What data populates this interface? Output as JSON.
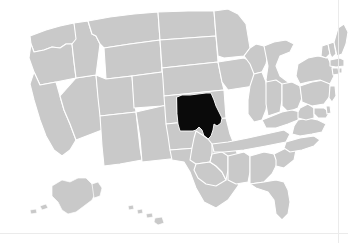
{
  "figure": {
    "type": "choropleth-locator-map",
    "title": "United States map with Missouri highlighted",
    "region_scope": "United States of America",
    "projection_note": "Albers-style composite with Alaska and Hawaii insets",
    "background_color": "#ffffff",
    "border_line_color": "#ebebeb"
  },
  "legend": {
    "default_fill": "#c9c9c9",
    "highlight_fill": "#0a0a0a",
    "border_stroke": "#ffffff",
    "default_label": "Other states",
    "highlight_label": "Missouri"
  },
  "highlighted": {
    "name": "Missouri",
    "abbr": "MO",
    "fill": "#0a0a0a"
  },
  "insets": [
    {
      "name": "Alaska",
      "abbr": "AK",
      "fill": "#c9c9c9"
    },
    {
      "name": "Hawaii",
      "abbr": "HI",
      "fill": "#c9c9c9"
    }
  ],
  "states": [
    {
      "abbr": "WA",
      "name": "Washington",
      "fill": "#c9c9c9"
    },
    {
      "abbr": "OR",
      "name": "Oregon",
      "fill": "#c9c9c9"
    },
    {
      "abbr": "CA",
      "name": "California",
      "fill": "#c9c9c9"
    },
    {
      "abbr": "NV",
      "name": "Nevada",
      "fill": "#c9c9c9"
    },
    {
      "abbr": "ID",
      "name": "Idaho",
      "fill": "#c9c9c9"
    },
    {
      "abbr": "MT",
      "name": "Montana",
      "fill": "#c9c9c9"
    },
    {
      "abbr": "WY",
      "name": "Wyoming",
      "fill": "#c9c9c9"
    },
    {
      "abbr": "UT",
      "name": "Utah",
      "fill": "#c9c9c9"
    },
    {
      "abbr": "AZ",
      "name": "Arizona",
      "fill": "#c9c9c9"
    },
    {
      "abbr": "CO",
      "name": "Colorado",
      "fill": "#c9c9c9"
    },
    {
      "abbr": "NM",
      "name": "New Mexico",
      "fill": "#c9c9c9"
    },
    {
      "abbr": "ND",
      "name": "North Dakota",
      "fill": "#c9c9c9"
    },
    {
      "abbr": "SD",
      "name": "South Dakota",
      "fill": "#c9c9c9"
    },
    {
      "abbr": "NE",
      "name": "Nebraska",
      "fill": "#c9c9c9"
    },
    {
      "abbr": "KS",
      "name": "Kansas",
      "fill": "#c9c9c9"
    },
    {
      "abbr": "OK",
      "name": "Oklahoma",
      "fill": "#c9c9c9"
    },
    {
      "abbr": "TX",
      "name": "Texas",
      "fill": "#c9c9c9"
    },
    {
      "abbr": "MN",
      "name": "Minnesota",
      "fill": "#c9c9c9"
    },
    {
      "abbr": "IA",
      "name": "Iowa",
      "fill": "#c9c9c9"
    },
    {
      "abbr": "MO",
      "name": "Missouri",
      "fill": "#0a0a0a"
    },
    {
      "abbr": "AR",
      "name": "Arkansas",
      "fill": "#c9c9c9"
    },
    {
      "abbr": "LA",
      "name": "Louisiana",
      "fill": "#c9c9c9"
    },
    {
      "abbr": "WI",
      "name": "Wisconsin",
      "fill": "#c9c9c9"
    },
    {
      "abbr": "IL",
      "name": "Illinois",
      "fill": "#c9c9c9"
    },
    {
      "abbr": "MS",
      "name": "Mississippi",
      "fill": "#c9c9c9"
    },
    {
      "abbr": "MI",
      "name": "Michigan",
      "fill": "#c9c9c9"
    },
    {
      "abbr": "IN",
      "name": "Indiana",
      "fill": "#c9c9c9"
    },
    {
      "abbr": "OH",
      "name": "Ohio",
      "fill": "#c9c9c9"
    },
    {
      "abbr": "KY",
      "name": "Kentucky",
      "fill": "#c9c9c9"
    },
    {
      "abbr": "TN",
      "name": "Tennessee",
      "fill": "#c9c9c9"
    },
    {
      "abbr": "AL",
      "name": "Alabama",
      "fill": "#c9c9c9"
    },
    {
      "abbr": "GA",
      "name": "Georgia",
      "fill": "#c9c9c9"
    },
    {
      "abbr": "FL",
      "name": "Florida",
      "fill": "#c9c9c9"
    },
    {
      "abbr": "SC",
      "name": "South Carolina",
      "fill": "#c9c9c9"
    },
    {
      "abbr": "NC",
      "name": "North Carolina",
      "fill": "#c9c9c9"
    },
    {
      "abbr": "VA",
      "name": "Virginia",
      "fill": "#c9c9c9"
    },
    {
      "abbr": "WV",
      "name": "West Virginia",
      "fill": "#c9c9c9"
    },
    {
      "abbr": "MD",
      "name": "Maryland",
      "fill": "#c9c9c9"
    },
    {
      "abbr": "DE",
      "name": "Delaware",
      "fill": "#c9c9c9"
    },
    {
      "abbr": "PA",
      "name": "Pennsylvania",
      "fill": "#c9c9c9"
    },
    {
      "abbr": "NJ",
      "name": "New Jersey",
      "fill": "#c9c9c9"
    },
    {
      "abbr": "NY",
      "name": "New York",
      "fill": "#c9c9c9"
    },
    {
      "abbr": "CT",
      "name": "Connecticut",
      "fill": "#c9c9c9"
    },
    {
      "abbr": "RI",
      "name": "Rhode Island",
      "fill": "#c9c9c9"
    },
    {
      "abbr": "MA",
      "name": "Massachusetts",
      "fill": "#c9c9c9"
    },
    {
      "abbr": "VT",
      "name": "Vermont",
      "fill": "#c9c9c9"
    },
    {
      "abbr": "NH",
      "name": "New Hampshire",
      "fill": "#c9c9c9"
    },
    {
      "abbr": "ME",
      "name": "Maine",
      "fill": "#c9c9c9"
    },
    {
      "abbr": "AK",
      "name": "Alaska",
      "fill": "#c9c9c9"
    },
    {
      "abbr": "HI",
      "name": "Hawaii",
      "fill": "#c9c9c9"
    }
  ]
}
